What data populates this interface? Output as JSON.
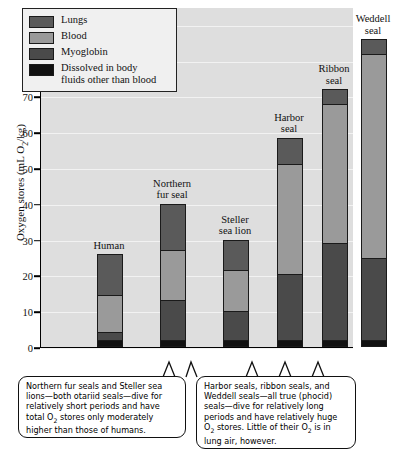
{
  "chart_data": {
    "type": "bar",
    "subtype": "stacked",
    "title": "",
    "xlabel": "",
    "ylabel": "Oxygen stores (mL O2/kg)",
    "ylim": [
      0,
      95
    ],
    "yticks": [
      0,
      10,
      20,
      30,
      40,
      50,
      60,
      70,
      80,
      90
    ],
    "grid": true,
    "legend_position": "top-left",
    "categories": [
      "Human",
      "Northern fur seal",
      "Steller sea lion",
      "Harbor seal",
      "Ribbon seal",
      "Weddell seal"
    ],
    "series": [
      {
        "name": "Dissolved in body fluids other than blood",
        "color": "#111111",
        "values": [
          2,
          2,
          2,
          2,
          2,
          2
        ]
      },
      {
        "name": "Myoglobin",
        "color": "#4a4a4a",
        "values": [
          2.2,
          11,
          8,
          18.5,
          27,
          23
        ]
      },
      {
        "name": "Blood",
        "color": "#9a9a9a",
        "values": [
          10.3,
          14,
          11.5,
          30.5,
          39,
          57
        ]
      },
      {
        "name": "Lungs",
        "color": "#5a5a5a",
        "values": [
          11.5,
          13,
          8.5,
          7.5,
          4,
          4
        ]
      }
    ],
    "totals": [
      26,
      40,
      30,
      58.5,
      72,
      86
    ]
  },
  "legend": {
    "items": [
      {
        "label": "Lungs",
        "color": "#5a5a5a"
      },
      {
        "label": "Blood",
        "color": "#9a9a9a"
      },
      {
        "label": "Myoglobin",
        "color": "#4a4a4a"
      },
      {
        "label": "Dissolved in body\nfluids other than blood",
        "color": "#111111"
      }
    ]
  },
  "axis": {
    "y_label_pre": "Oxygen stores (mL O",
    "y_label_sub": "2",
    "y_label_post": "/kg)",
    "ticks": [
      "90",
      "80",
      "70",
      "60",
      "50",
      "40",
      "30",
      "20",
      "10",
      "0"
    ]
  },
  "bar_labels": {
    "human": "Human",
    "northern_fur_seal": "Northern\nfur seal",
    "steller_sea_lion": "Steller\nsea lion",
    "harbor_seal": "Harbor\nseal",
    "ribbon_seal": "Ribbon\nseal",
    "weddell_seal": "Weddell\nseal"
  },
  "callouts": {
    "left": {
      "line1": "Northern fur seals and Steller sea",
      "line2": "lions—both otariid seals—dive for",
      "line3": "relatively short periods and have",
      "line4_pre": "total O",
      "line4_sub": "2",
      "line4_post": " stores only moderately",
      "line5": "higher than those of humans."
    },
    "right": {
      "line1": "Harbor seals, ribbon seals, and",
      "line2": "Weddell seals—all true (phocid)",
      "line3": "seals—dive for relatively long",
      "line4": "periods and have relatively huge",
      "line5_pre": "O",
      "line5_sub": "2",
      "line5_mid": " stores. Little of their O",
      "line5_sub2": "2",
      "line5_post": " is in",
      "line6": "lung air, however."
    }
  }
}
